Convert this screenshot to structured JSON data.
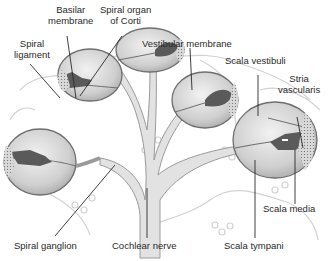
{
  "diagram": {
    "colors": {
      "background": "#ffffff",
      "duct_fill": "#d6d6d6",
      "duct_outline": "#6e6e6e",
      "organ_fill": "#5a5a5a",
      "faint_outline": "#d2d2d2",
      "leader_line": "#2a2a2a",
      "text": "#2a2a2a"
    },
    "labels": {
      "basilar_membrane": {
        "line1": "Basilar",
        "line2": "membrane"
      },
      "spiral_organ": {
        "line1": "Spiral organ",
        "line2": "of Corti"
      },
      "spiral_ligament": {
        "line1": "Spiral",
        "line2": "ligament"
      },
      "vestibular_membrane": "Vestibular membrane",
      "scala_vestibuli": "Scala vestibuli",
      "stria_vascularis": {
        "line1": "Stria",
        "line2": "vascularis"
      },
      "scala_media": "Scala media",
      "spiral_ganglion": "Spiral ganglion",
      "cochlear_nerve": "Cochlear nerve",
      "scala_tympani": "Scala tympani"
    }
  }
}
